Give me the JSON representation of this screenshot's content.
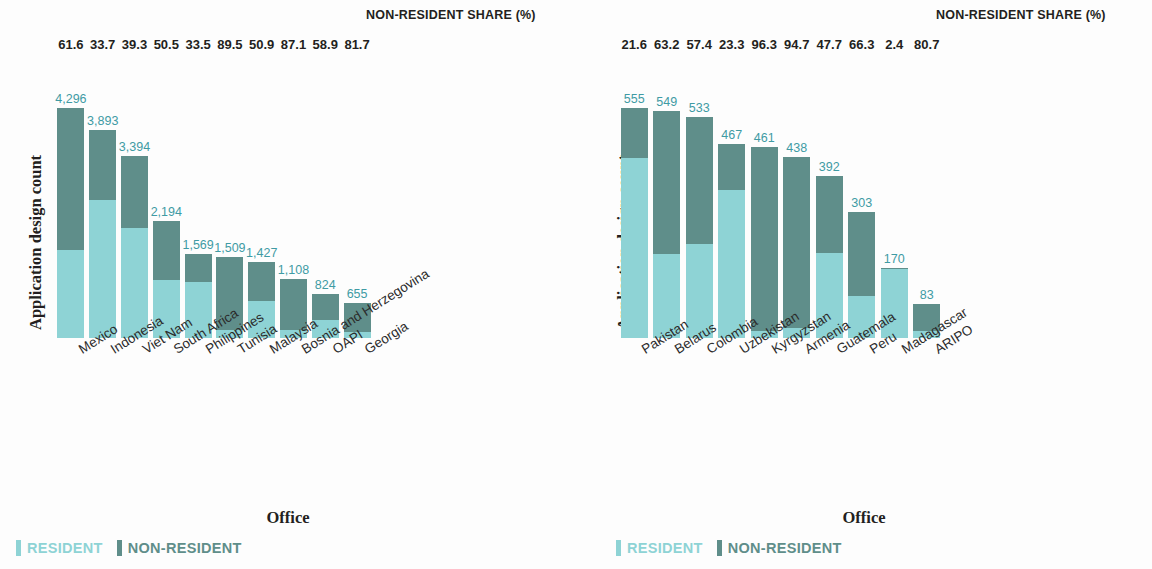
{
  "common": {
    "share_header": "NON-RESIDENT SHARE (%)",
    "y_axis_title": "Application design count",
    "x_axis_title": "Office",
    "legend": [
      {
        "name": "resident-legend",
        "label": "RESIDENT",
        "color": "#8ed3d5"
      },
      {
        "name": "nonresident-legend",
        "label": "NON-RESIDENT",
        "color": "#5f8e8a"
      }
    ]
  },
  "chart_data": [
    {
      "type": "bar",
      "id": "left-chart",
      "title": "",
      "xlabel": "Office",
      "ylabel": "Application design count",
      "stacked": true,
      "grid": false,
      "legend_position": "bottom-left",
      "ylim": [
        0,
        4296
      ],
      "categories": [
        "Mexico",
        "Indonesia",
        "Viet Nam",
        "South Africa",
        "Philippines",
        "Tunisia",
        "Malaysia",
        "Bosnia and Herzegovina",
        "OAPI",
        "Georgia"
      ],
      "totals": [
        4296,
        3893,
        3394,
        2194,
        1569,
        1509,
        1427,
        1108,
        824,
        655
      ],
      "total_labels": [
        "4,296",
        "3,893",
        "3,394",
        "2,194",
        "1,569",
        "1,509",
        "1,427",
        "1,108",
        "824",
        "655"
      ],
      "nonresident_share_pct": [
        61.6,
        33.7,
        39.3,
        50.5,
        33.5,
        89.5,
        50.9,
        87.1,
        58.9,
        81.7
      ],
      "nonresident_share_labels": [
        "61.6",
        "33.7",
        "39.3",
        "50.5",
        "33.5",
        "89.5",
        "50.9",
        "87.1",
        "58.9",
        "81.7"
      ],
      "series": [
        {
          "name": "RESIDENT",
          "color": "#8ed3d5",
          "values": [
            1650,
            2581,
            2060,
            1086,
            1043,
            158,
            700,
            143,
            339,
            120
          ]
        },
        {
          "name": "NON-RESIDENT",
          "color": "#5f8e8a",
          "values": [
            2646,
            1312,
            1334,
            1108,
            526,
            1351,
            727,
            965,
            485,
            535
          ]
        }
      ]
    },
    {
      "type": "bar",
      "id": "right-chart",
      "title": "",
      "xlabel": "Office",
      "ylabel": "Application design count",
      "stacked": true,
      "grid": false,
      "legend_position": "bottom-left",
      "ylim": [
        0,
        555
      ],
      "categories": [
        "Pakistan",
        "Belarus",
        "Colombia",
        "Uzbekistan",
        "Kyrgyzstan",
        "Armenia",
        "Guatemala",
        "Peru",
        "Madagascar",
        "ARIPO"
      ],
      "totals": [
        555,
        549,
        533,
        467,
        461,
        438,
        392,
        303,
        170,
        83
      ],
      "total_labels": [
        "555",
        "549",
        "533",
        "467",
        "461",
        "438",
        "392",
        "303",
        "170",
        "83"
      ],
      "nonresident_share_pct": [
        21.6,
        63.2,
        57.4,
        23.3,
        96.3,
        94.7,
        47.7,
        66.3,
        2.4,
        80.7
      ],
      "nonresident_share_labels": [
        "21.6",
        "63.2",
        "57.4",
        "23.3",
        "96.3",
        "94.7",
        "47.7",
        "66.3",
        "2.4",
        "80.7"
      ],
      "series": [
        {
          "name": "RESIDENT",
          "color": "#8ed3d5",
          "values": [
            435,
            202,
            227,
            358,
            17,
            23,
            205,
            102,
            166,
            16
          ]
        },
        {
          "name": "NON-RESIDENT",
          "color": "#5f8e8a",
          "values": [
            120,
            347,
            306,
            109,
            444,
            415,
            187,
            201,
            4,
            67
          ]
        }
      ]
    }
  ]
}
